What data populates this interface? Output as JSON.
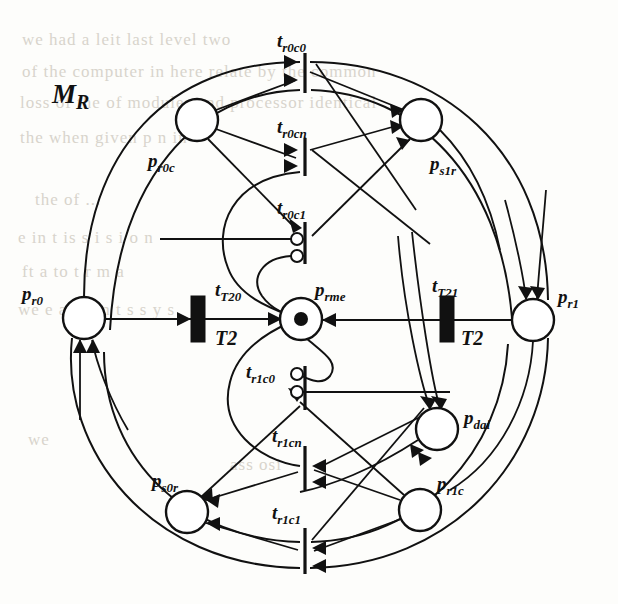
{
  "figure": {
    "name": "MR",
    "title_label": "M",
    "title_sub": "R",
    "type": "petri-net",
    "background_color": "#fdfdfb",
    "ink_color": "#111111"
  },
  "places": [
    {
      "id": "p_r0c",
      "label": "p",
      "sub": "r0c",
      "cx": 197,
      "cy": 120,
      "r": 21,
      "token": false
    },
    {
      "id": "p_s1r",
      "label": "p",
      "sub": "s1r",
      "cx": 421,
      "cy": 120,
      "r": 21,
      "token": false
    },
    {
      "id": "p_r0",
      "label": "p",
      "sub": "r0",
      "cx": 84,
      "cy": 318,
      "r": 21,
      "token": false
    },
    {
      "id": "p_rme",
      "label": "p",
      "sub": "rme",
      "cx": 301,
      "cy": 319,
      "r": 21,
      "token": true
    },
    {
      "id": "p_r1",
      "label": "p",
      "sub": "r1",
      "cx": 533,
      "cy": 320,
      "r": 21,
      "token": false
    },
    {
      "id": "p_dai",
      "label": "p",
      "sub": "dai",
      "cx": 437,
      "cy": 429,
      "r": 21,
      "token": false
    },
    {
      "id": "p_r1c",
      "label": "p",
      "sub": "r1c",
      "cx": 420,
      "cy": 510,
      "r": 21,
      "token": false
    },
    {
      "id": "p_s0r",
      "label": "p",
      "sub": "s0r",
      "cx": 187,
      "cy": 512,
      "r": 21,
      "token": false
    }
  ],
  "place_labels": [
    {
      "id": "p_r0c",
      "text": "p",
      "sub": "r0c",
      "x": 148,
      "y": 167
    },
    {
      "id": "p_s1r",
      "text": "p",
      "sub": "s1r",
      "x": 430,
      "y": 170
    },
    {
      "id": "p_r0",
      "text": "p",
      "sub": "r0",
      "x": 22,
      "y": 300
    },
    {
      "id": "p_rme",
      "text": "p",
      "sub": "rme",
      "x": 315,
      "y": 296
    },
    {
      "id": "p_r1",
      "text": "p",
      "sub": "r1",
      "x": 558,
      "y": 303
    },
    {
      "id": "p_dai",
      "text": "p",
      "sub": "dai",
      "x": 464,
      "y": 424
    },
    {
      "id": "p_r1c",
      "text": "p",
      "sub": "r1c",
      "x": 437,
      "y": 490
    },
    {
      "id": "p_s0r",
      "text": "p",
      "sub": "s0r",
      "x": 152,
      "y": 487
    }
  ],
  "transitions": [
    {
      "id": "t_r0c0",
      "label": "t",
      "sub": "r0c0",
      "kind": "bar",
      "x": 305,
      "y": 53,
      "h": 40,
      "label_x": 277,
      "label_y": 47
    },
    {
      "id": "t_r0cn",
      "label": "t",
      "sub": "r0cn",
      "kind": "bar",
      "x": 305,
      "y": 138,
      "h": 38,
      "label_x": 277,
      "label_y": 133
    },
    {
      "id": "t_r0c1",
      "label": "t",
      "sub": "r0c1",
      "kind": "bar",
      "x": 305,
      "y": 222,
      "h": 42,
      "label_x": 277,
      "label_y": 214
    },
    {
      "id": "t_T20",
      "label": "t",
      "sub": "T20",
      "kind": "box",
      "x": 191,
      "y": 296,
      "w": 14,
      "h": 46,
      "label_x": 215,
      "label_y": 296,
      "sublabel": "T2",
      "sublabel_x": 215,
      "sublabel_y": 345
    },
    {
      "id": "t_T21",
      "label": "t",
      "sub": "T21",
      "kind": "box",
      "x": 440,
      "y": 296,
      "w": 14,
      "h": 46,
      "label_x": 432,
      "label_y": 292,
      "sublabel": "T2",
      "sublabel_x": 461,
      "sublabel_y": 345
    },
    {
      "id": "t_r1c0",
      "label": "t",
      "sub": "r1c0",
      "kind": "bar",
      "x": 305,
      "y": 366,
      "h": 44,
      "label_x": 246,
      "label_y": 378
    },
    {
      "id": "t_r1cn",
      "label": "t",
      "sub": "r1cn",
      "kind": "bar",
      "x": 305,
      "y": 446,
      "h": 44,
      "label_x": 272,
      "label_y": 442
    },
    {
      "id": "t_r1c1",
      "label": "t",
      "sub": "r1c1",
      "kind": "bar",
      "x": 305,
      "y": 528,
      "h": 46,
      "label_x": 272,
      "label_y": 519
    }
  ],
  "transition_labels": [
    {
      "id": "t_r0c0",
      "text": "t",
      "sub": "r0c0"
    },
    {
      "id": "t_r0cn",
      "text": "t",
      "sub": "r0cn"
    },
    {
      "id": "t_r0c1",
      "text": "t",
      "sub": "r0c1"
    },
    {
      "id": "t_T20",
      "text": "t",
      "sub": "T20",
      "extra": "T2"
    },
    {
      "id": "t_T21",
      "text": "t",
      "sub": "T21",
      "extra": "T2"
    },
    {
      "id": "t_r1c0",
      "text": "t",
      "sub": "r1c0"
    },
    {
      "id": "t_r1cn",
      "text": "t",
      "sub": "r1cn"
    },
    {
      "id": "t_r1c1",
      "text": "t",
      "sub": "r1c1"
    }
  ],
  "inhibitor_arcs": [
    {
      "id": "inh-r0c1-a",
      "cx": 297,
      "cy": 239,
      "r": 6
    },
    {
      "id": "inh-r0c1-b",
      "cx": 297,
      "cy": 256,
      "r": 6
    },
    {
      "id": "inh-r1c0-a",
      "cx": 297,
      "cy": 374,
      "r": 6
    },
    {
      "id": "inh-r1c0-b",
      "cx": 297,
      "cy": 392,
      "r": 6
    }
  ],
  "annotations": {
    "t2_left": "T2",
    "t2_right": "T2"
  },
  "ghost_text": [
    {
      "x": 22,
      "y": 30,
      "text": "we had a      leit  last    level   two"
    },
    {
      "x": 22,
      "y": 62,
      "text": "of the computer       in  here  relate  by  the  common"
    },
    {
      "x": 20,
      "y": 93,
      "text": "loss of the     of modules and processor  identical"
    },
    {
      "x": 20,
      "y": 128,
      "text": "the         when     given    p  n   in"
    },
    {
      "x": 35,
      "y": 190,
      "text": "the    of  ..."
    },
    {
      "x": 18,
      "y": 228,
      "text": "e  in      t is s  i  s  i o n"
    },
    {
      "x": 22,
      "y": 262,
      "text": "ft     a   to   t   r m a"
    },
    {
      "x": 18,
      "y": 300,
      "text": "we e  a  g e n t s  s y s"
    },
    {
      "x": 28,
      "y": 430,
      "text": "we"
    },
    {
      "x": 230,
      "y": 455,
      "text": "ass   osi"
    }
  ]
}
